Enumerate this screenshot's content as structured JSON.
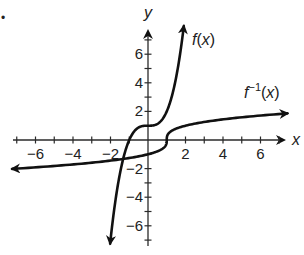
{
  "chart_data": {
    "type": "line",
    "title": "",
    "xlabel": "x",
    "ylabel": "y",
    "xlim": [
      -7.2,
      7.5
    ],
    "ylim": [
      -7.2,
      7.9
    ],
    "grid": false,
    "x_ticks": [
      -6,
      -4,
      -2,
      2,
      4,
      6
    ],
    "y_ticks": [
      -6,
      -4,
      -2,
      2,
      4,
      6
    ],
    "minor_ticks_every": 1,
    "series": [
      {
        "name": "f(x)",
        "label_parts": {
          "f": "f",
          "paren_open": "(",
          "x": "x",
          "paren_close": ")"
        },
        "formula": "x^3 + 1",
        "x": [
          -2.02,
          -1.75,
          -1.5,
          -1.25,
          -1.0,
          -0.75,
          -0.5,
          -0.25,
          0,
          0.25,
          0.5,
          0.75,
          1.0,
          1.25,
          1.5,
          1.75,
          1.91
        ],
        "y": [
          -7.24,
          -4.36,
          -2.38,
          -0.95,
          0,
          0.58,
          0.88,
          0.98,
          1,
          1.02,
          1.13,
          1.42,
          2,
          2.95,
          4.38,
          6.36,
          7.97
        ],
        "arrows": "both"
      },
      {
        "name": "f^-1(x)",
        "label_parts": {
          "f": "f",
          "sup": "−1",
          "paren_open": "(",
          "x": "x",
          "paren_close": ")"
        },
        "formula": "cbrt(x - 1)",
        "x": [
          -7.2,
          -6,
          -4,
          -2,
          -1,
          0,
          0.5,
          0.9,
          1,
          1.1,
          1.5,
          2,
          3,
          4,
          6,
          7.47
        ],
        "y": [
          -2.02,
          -1.91,
          -1.71,
          -1.44,
          -1.26,
          -1,
          -0.79,
          -0.46,
          0,
          0.46,
          0.79,
          1,
          1.26,
          1.44,
          1.71,
          1.86
        ],
        "arrows": "both"
      }
    ]
  },
  "page": {
    "marker_dot": "•"
  }
}
